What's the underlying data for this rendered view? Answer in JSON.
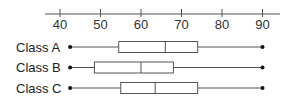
{
  "chart_data": {
    "type": "boxplot",
    "orientation": "horizontal",
    "title": "",
    "xlabel": "",
    "ylabel": "",
    "xlim": [
      40,
      90
    ],
    "axis_position": "top",
    "grid": false,
    "ticks": [
      40,
      50,
      60,
      70,
      80,
      90
    ],
    "tick_labels": [
      "40",
      "50",
      "60",
      "70",
      "80",
      "90"
    ],
    "categories": [
      "Class A",
      "Class B",
      "Class C"
    ],
    "series": [
      {
        "name": "Class A",
        "min": 42.5,
        "q1": 54.5,
        "median": 66,
        "q3": 74,
        "max": 90
      },
      {
        "name": "Class B",
        "min": 42.5,
        "q1": 48.5,
        "median": 60,
        "q3": 68,
        "max": 90
      },
      {
        "name": "Class C",
        "min": 42.5,
        "q1": 55,
        "median": 63.5,
        "q3": 74,
        "max": 90
      }
    ],
    "colors": {
      "line": "#555555",
      "box_fill": "#ffffff",
      "dot": "#111111"
    }
  }
}
